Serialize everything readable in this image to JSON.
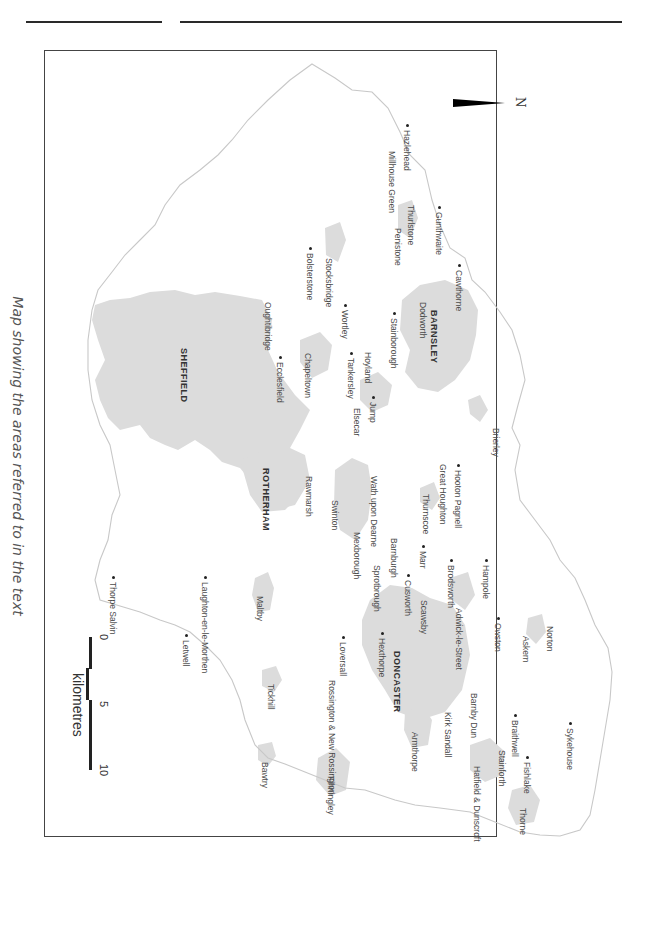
{
  "page": {
    "caption": "Map showing the areas referred to in the text"
  },
  "map": {
    "orientation": "rotated 90 degrees clockwise (north points right)",
    "north_arrow_label": "N",
    "scale_bar": {
      "unit": "kilometres",
      "ticks": [
        "0",
        "5",
        "10"
      ]
    },
    "colors": {
      "urban_fill": "#dcdcdc",
      "boundary_line": "#c8c8c8",
      "frame": "#444444",
      "text": "#4a4a4a"
    },
    "major_towns": [
      {
        "name": "SHEFFIELD",
        "x": 188,
        "y": 348
      },
      {
        "name": "ROTHERHAM",
        "x": 270,
        "y": 468
      },
      {
        "name": "BARNSLEY",
        "x": 438,
        "y": 310
      },
      {
        "name": "DONCASTER",
        "x": 401,
        "y": 651
      }
    ],
    "places": [
      {
        "name": "Hazlehead",
        "x": 411,
        "y": 130,
        "dot": true
      },
      {
        "name": "Millhouse Green",
        "x": 396,
        "y": 151,
        "dot": false
      },
      {
        "name": "Thurlstone",
        "x": 415,
        "y": 205,
        "dot": false
      },
      {
        "name": "Penistone",
        "x": 402,
        "y": 228,
        "dot": false
      },
      {
        "name": "Gunthwaite",
        "x": 443,
        "y": 212,
        "dot": true
      },
      {
        "name": "Cawthorne",
        "x": 463,
        "y": 270,
        "dot": true
      },
      {
        "name": "Dodworth",
        "x": 427,
        "y": 302,
        "dot": false
      },
      {
        "name": "Stainborough",
        "x": 398,
        "y": 318,
        "dot": true
      },
      {
        "name": "Stocksbridge",
        "x": 333,
        "y": 258,
        "dot": false
      },
      {
        "name": "Bolsterstone",
        "x": 314,
        "y": 253,
        "dot": true
      },
      {
        "name": "Wortley",
        "x": 349,
        "y": 310,
        "dot": true
      },
      {
        "name": "Hoyland",
        "x": 372,
        "y": 352,
        "dot": false
      },
      {
        "name": "Tankersley",
        "x": 355,
        "y": 358,
        "dot": true
      },
      {
        "name": "Jump",
        "x": 377,
        "y": 402,
        "dot": true
      },
      {
        "name": "Elsecar",
        "x": 361,
        "y": 408,
        "dot": false
      },
      {
        "name": "Oughtibridge",
        "x": 272,
        "y": 302,
        "dot": false
      },
      {
        "name": "Ecclesfield",
        "x": 284,
        "y": 362,
        "dot": true
      },
      {
        "name": "Chapeltown",
        "x": 312,
        "y": 353,
        "dot": false
      },
      {
        "name": "Brierley",
        "x": 500,
        "y": 428,
        "dot": false
      },
      {
        "name": "Hooton Pagnell",
        "x": 462,
        "y": 470,
        "dot": true
      },
      {
        "name": "Great Houghton",
        "x": 447,
        "y": 464,
        "dot": false
      },
      {
        "name": "Thurnscoe",
        "x": 430,
        "y": 494,
        "dot": false
      },
      {
        "name": "Wath upon Dearne",
        "x": 378,
        "y": 476,
        "dot": false
      },
      {
        "name": "Swinton",
        "x": 339,
        "y": 500,
        "dot": false
      },
      {
        "name": "Rawmarsh",
        "x": 313,
        "y": 476,
        "dot": false
      },
      {
        "name": "Mexborough",
        "x": 361,
        "y": 532,
        "dot": false
      },
      {
        "name": "Barnburgh",
        "x": 398,
        "y": 538,
        "dot": false
      },
      {
        "name": "Sprotbrough",
        "x": 381,
        "y": 565,
        "dot": false
      },
      {
        "name": "Marr",
        "x": 427,
        "y": 551,
        "dot": true
      },
      {
        "name": "Cusworth",
        "x": 412,
        "y": 580,
        "dot": true
      },
      {
        "name": "Scawsby",
        "x": 428,
        "y": 600,
        "dot": false
      },
      {
        "name": "Brodsworth",
        "x": 455,
        "y": 565,
        "dot": true
      },
      {
        "name": "Hampole",
        "x": 490,
        "y": 565,
        "dot": true
      },
      {
        "name": "Adwick-le-Street",
        "x": 463,
        "y": 608,
        "dot": false
      },
      {
        "name": "Owston",
        "x": 502,
        "y": 623,
        "dot": true
      },
      {
        "name": "Askern",
        "x": 530,
        "y": 636,
        "dot": false
      },
      {
        "name": "Norton",
        "x": 554,
        "y": 626,
        "dot": false
      },
      {
        "name": "Hexthorpe",
        "x": 386,
        "y": 638,
        "dot": true
      },
      {
        "name": "Loversall",
        "x": 347,
        "y": 642,
        "dot": true
      },
      {
        "name": "Rossington & New Rossington",
        "x": 336,
        "y": 680,
        "dot": false
      },
      {
        "name": "Armthorpe",
        "x": 419,
        "y": 732,
        "dot": false
      },
      {
        "name": "Kirk Sandall",
        "x": 452,
        "y": 712,
        "dot": false
      },
      {
        "name": "Barnby Dun",
        "x": 478,
        "y": 693,
        "dot": false
      },
      {
        "name": "Braithwell",
        "x": 519,
        "y": 720,
        "dot": true
      },
      {
        "name": "Stainforth",
        "x": 506,
        "y": 750,
        "dot": false
      },
      {
        "name": "Hatfield & Dunscroft",
        "x": 481,
        "y": 766,
        "dot": false
      },
      {
        "name": "Fishlake",
        "x": 531,
        "y": 762,
        "dot": true
      },
      {
        "name": "Thorne",
        "x": 527,
        "y": 808,
        "dot": false
      },
      {
        "name": "Sykehouse",
        "x": 574,
        "y": 728,
        "dot": true
      },
      {
        "name": "Maltby",
        "x": 264,
        "y": 596,
        "dot": false
      },
      {
        "name": "Tickhill",
        "x": 275,
        "y": 684,
        "dot": false
      },
      {
        "name": "Bawtry",
        "x": 269,
        "y": 762,
        "dot": false
      },
      {
        "name": "Finningley",
        "x": 335,
        "y": 776,
        "dot": false
      },
      {
        "name": "Laughton-en-le-Morthen",
        "x": 209,
        "y": 582,
        "dot": true
      },
      {
        "name": "Letwell",
        "x": 190,
        "y": 640,
        "dot": true
      },
      {
        "name": "Thorpe Salvin",
        "x": 117,
        "y": 582,
        "dot": true
      }
    ]
  }
}
